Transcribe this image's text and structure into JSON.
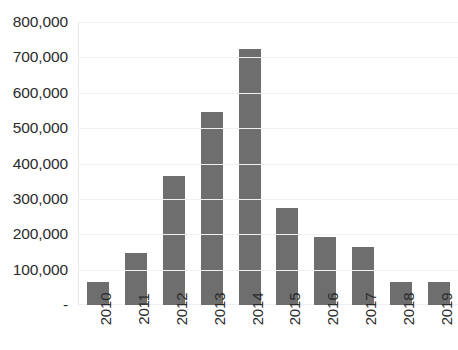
{
  "chart_data": {
    "type": "bar",
    "title": "...nanciamientos consolidad...",
    "xlabel": "",
    "ylabel": "",
    "categories": [
      "2010",
      "2011",
      "2012",
      "2013",
      "2014",
      "2015",
      "2016",
      "2017",
      "2018",
      "2019"
    ],
    "values": [
      65000,
      147000,
      365000,
      545000,
      724000,
      274000,
      192000,
      164000,
      65000,
      65000
    ],
    "ylim": [
      0,
      800000
    ],
    "ytick_labels": [
      "800,000",
      "700,000",
      "600,000",
      "500,000",
      "400,000",
      "300,000",
      "200,000",
      "100,000",
      "-"
    ],
    "ytick_values": [
      800000,
      700000,
      600000,
      500000,
      400000,
      300000,
      200000,
      100000,
      0
    ],
    "grid": true,
    "legend": null,
    "series": [
      {
        "name": "Financiamientos consolidados",
        "color": "#6e6e6e",
        "values": [
          65000,
          147000,
          365000,
          545000,
          724000,
          274000,
          192000,
          164000,
          65000,
          65000
        ]
      }
    ]
  },
  "colors": {
    "bar": "#6e6e6e",
    "gridline": "#f1f1f1",
    "text": "#2b2b2b",
    "background": "#ffffff"
  }
}
